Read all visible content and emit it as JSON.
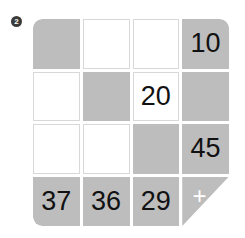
{
  "exercise": {
    "number_badge": "2"
  },
  "grid": {
    "rows": 4,
    "columns": 4,
    "shaded_color": "#bdbdbd",
    "blank_color": "#ffffff",
    "text_color": "#111111",
    "plus_symbol": "+",
    "cells": [
      {
        "value": "",
        "state": "shaded"
      },
      {
        "value": "",
        "state": "blank"
      },
      {
        "value": "",
        "state": "blank"
      },
      {
        "value": "10",
        "state": "shaded"
      },
      {
        "value": "",
        "state": "blank"
      },
      {
        "value": "",
        "state": "shaded"
      },
      {
        "value": "20",
        "state": "blank"
      },
      {
        "value": "",
        "state": "shaded"
      },
      {
        "value": "",
        "state": "blank"
      },
      {
        "value": "",
        "state": "blank"
      },
      {
        "value": "",
        "state": "shaded"
      },
      {
        "value": "45",
        "state": "shaded"
      },
      {
        "value": "37",
        "state": "shaded"
      },
      {
        "value": "36",
        "state": "shaded"
      },
      {
        "value": "29",
        "state": "shaded"
      },
      {
        "value": "",
        "state": "triangle"
      }
    ]
  }
}
